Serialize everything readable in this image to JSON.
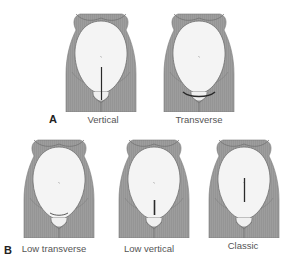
{
  "diagram": {
    "colors": {
      "body": "#9a9a9a",
      "body_outline": "#6e6e6e",
      "uterus": "#f4f4f4",
      "incision": "#2a2a2a",
      "text": "#555555"
    },
    "panels": [
      {
        "label": "A",
        "figures": [
          {
            "caption": "Vertical",
            "incision": "vertical-skin"
          },
          {
            "caption": "Transverse",
            "incision": "transverse-skin"
          }
        ]
      },
      {
        "label": "B",
        "figures": [
          {
            "caption": "Low transverse",
            "incision": "low-transverse-uterine"
          },
          {
            "caption": "Low vertical",
            "incision": "low-vertical-uterine"
          },
          {
            "caption": "Classic",
            "incision": "classic-uterine"
          }
        ]
      }
    ]
  }
}
